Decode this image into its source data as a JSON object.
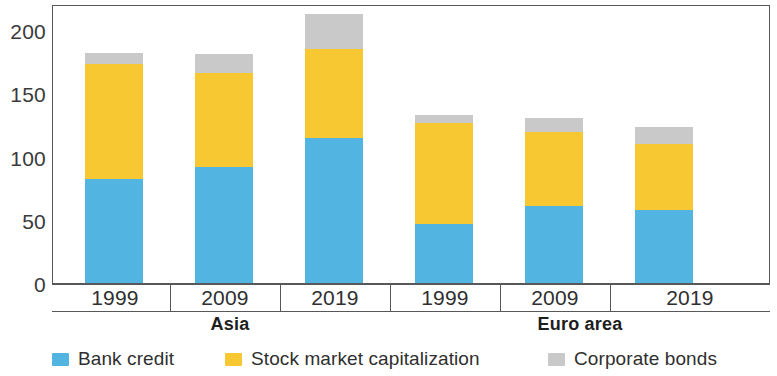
{
  "chart_data": {
    "type": "bar",
    "subtype": "stacked-bar",
    "title": "",
    "xlabel": "",
    "ylabel": "",
    "ylim": [
      0,
      222
    ],
    "yticks": [
      0,
      50,
      100,
      150,
      200
    ],
    "ytick_labels": [
      "0",
      "50",
      "100",
      "150",
      "200"
    ],
    "grid": false,
    "legend_position": "bottom",
    "categories": [
      "1999",
      "2009",
      "2019",
      "1999",
      "2009",
      "2019"
    ],
    "groups": [
      {
        "label": "Asia",
        "categories": [
          "1999",
          "2009",
          "2019"
        ]
      },
      {
        "label": "Euro area",
        "categories": [
          "1999",
          "2009",
          "2019"
        ]
      }
    ],
    "series": [
      {
        "name": "Bank credit",
        "color": "#52b4e0",
        "values": [
          83,
          92,
          115,
          47,
          61,
          58
        ]
      },
      {
        "name": "Stock market capitalization",
        "color": "#f8c832",
        "values": [
          91,
          75,
          71,
          80,
          59,
          53
        ]
      },
      {
        "name": "Corporate bonds",
        "color": "#c9c9c9",
        "values": [
          9,
          15,
          28,
          7,
          11,
          13
        ]
      }
    ],
    "totals": [
      183,
      182,
      214,
      134,
      131,
      124
    ]
  },
  "axis": {
    "y_labels": [
      "200",
      "150",
      "100",
      "50",
      "0"
    ]
  },
  "x_axis": {
    "labels": [
      "1999",
      "2009",
      "2019",
      "1999",
      "2009",
      "2019"
    ]
  },
  "group_labels": [
    {
      "label": "Asia"
    },
    {
      "label": "Euro area"
    }
  ],
  "legend": {
    "items": [
      {
        "label": "Bank credit",
        "color": "#52b4e0"
      },
      {
        "label": "Stock market capitalization",
        "color": "#f8c832"
      },
      {
        "label": "Corporate bonds",
        "color": "#c9c9c9"
      }
    ]
  }
}
